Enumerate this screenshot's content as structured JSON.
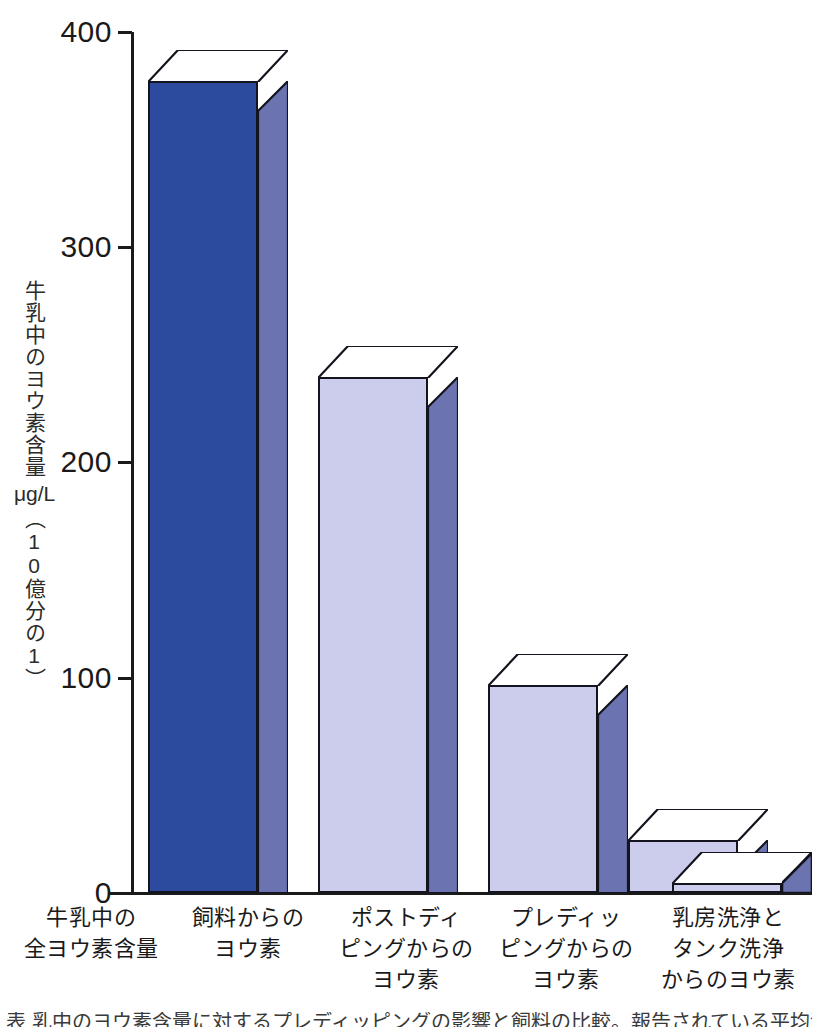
{
  "chart_data": {
    "type": "bar",
    "title": "",
    "xlabel": "",
    "ylabel": "牛乳中のヨウ素含量 μg/L (10億分の1)",
    "ylabel_parts": {
      "main": "牛乳中のヨウ素含量",
      "unit": "μg/L",
      "paren": "（10億分の1）"
    },
    "ylim": [
      0,
      400
    ],
    "yticks": [
      0,
      100,
      200,
      300,
      400
    ],
    "ytick_labels": [
      "0",
      "100",
      "200",
      "300",
      "400"
    ],
    "grid": false,
    "legend": "none",
    "style": "3d-bar",
    "categories": [
      "牛乳中の\n全ヨウ素含量",
      "飼料からの\nヨウ素",
      "ポストディ\nピングからの\nヨウ素",
      "プレディッ\nピングからの\nヨウ素",
      "乳房洗浄と\nタンク洗浄\nからのヨウ素"
    ],
    "category_lines": [
      [
        "牛乳中の",
        "全ヨウ素含量"
      ],
      [
        "飼料からの",
        "ヨウ素"
      ],
      [
        "ポストディ",
        "ピングからの",
        "ヨウ素"
      ],
      [
        "プレディッ",
        "ピングからの",
        "ヨウ素"
      ],
      [
        "乳房洗浄と",
        "タンク洗浄",
        "からのヨウ素"
      ]
    ],
    "values": [
      377,
      239,
      96,
      24,
      4
    ],
    "colors": {
      "bar1_front": "#2c4a9e",
      "bar_front": "#ccccec",
      "bar_side": "#6b73b0",
      "bar_top": "#ffffff",
      "outline": "#14141e",
      "axis": "#1a1a1a",
      "text": "#1a1a1a"
    }
  },
  "caption": {
    "bottom_clipped_text": "表 乳中のヨウ素含量に対するプレディッピングの影響と飼料の比較。報告されている平均濃度は、"
  }
}
